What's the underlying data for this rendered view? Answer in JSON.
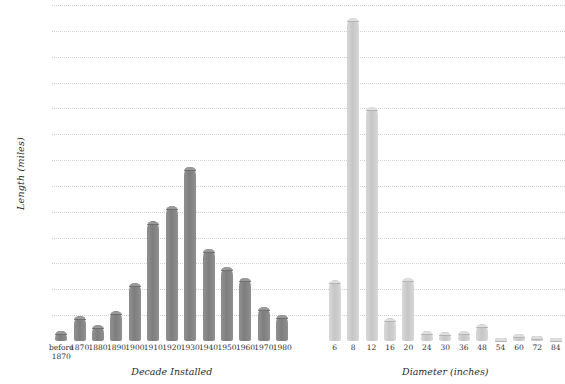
{
  "chart_data": {
    "type": "bar",
    "title": "",
    "ylabel": "Length (miles)",
    "ylim": [
      0,
      2600
    ],
    "ytick_step": 200,
    "grid": true,
    "legend": "none",
    "ytick_labels": [
      "2,600",
      "2,400",
      "2,200",
      "2,000",
      "1,800",
      "1,600",
      "1,400",
      "1,200",
      "1,000",
      "800",
      "600",
      "400",
      "200"
    ],
    "ytick_values": [
      2600,
      2400,
      2200,
      2000,
      1800,
      1600,
      1400,
      1200,
      1000,
      800,
      600,
      400,
      200
    ],
    "panels": [
      {
        "name": "decade-installed",
        "xlabel": "Decade Installed",
        "color": "#828282",
        "categories": [
          "before\n1870",
          "1870",
          "1880",
          "1890",
          "1900",
          "1910",
          "1920",
          "1930",
          "1940",
          "1950",
          "1960",
          "1970",
          "1980"
        ],
        "values": [
          80,
          195,
          125,
          230,
          450,
          925,
          1045,
          1350,
          715,
          575,
          490,
          265,
          205
        ]
      },
      {
        "name": "diameter-inches",
        "xlabel": "Diameter (inches)",
        "color": "#cccccc",
        "categories": [
          "6",
          "8",
          "12",
          "16",
          "20",
          "24",
          "30",
          "36",
          "48",
          "54",
          "60",
          "72",
          "84"
        ],
        "values": [
          470,
          2500,
          1810,
          175,
          490,
          75,
          68,
          80,
          130,
          15,
          55,
          40,
          18
        ]
      }
    ]
  }
}
